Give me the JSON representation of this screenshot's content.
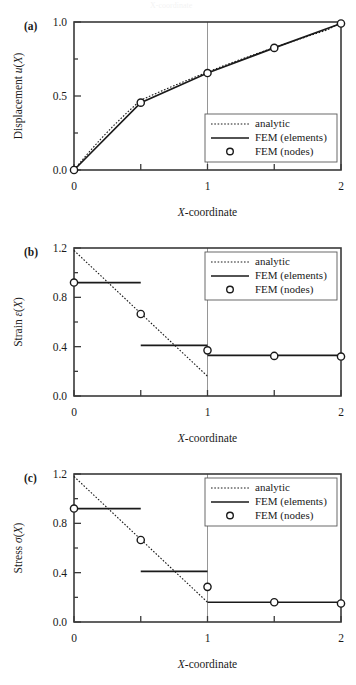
{
  "figure": {
    "panels": [
      {
        "tag": "(a)",
        "ylabel_prefix": "Displacement ",
        "ylabel_var": "u",
        "ylabel_suffix": "(X)",
        "xlabel_var": "X",
        "xlabel_rest": "-coordinate"
      },
      {
        "tag": "(b)",
        "ylabel_prefix": "Strain ",
        "ylabel_var": "ε",
        "ylabel_suffix": "(X)",
        "xlabel_var": "X",
        "xlabel_rest": "-coordinate"
      },
      {
        "tag": "(c)",
        "ylabel_prefix": "Stress ",
        "ylabel_var": "σ",
        "ylabel_suffix": "(X)",
        "xlabel_var": "X",
        "xlabel_rest": "-coordinate"
      }
    ],
    "legend": {
      "analytic": "analytic",
      "elements": "FEM (elements)",
      "nodes": "FEM (nodes)"
    },
    "colors": {
      "line": "#1a1a1a",
      "frame": "#3a3a3a",
      "gridline": "#8a8a8a",
      "marker_fill": "#ffffff",
      "background": "#ffffff"
    },
    "top_bleed_text": "X-coordinate"
  },
  "chart_data": [
    {
      "type": "line",
      "panel": "a",
      "title": "",
      "xlabel": "X-coordinate",
      "ylabel": "Displacement u(X)",
      "xlim": [
        0,
        2
      ],
      "ylim": [
        0,
        1.0
      ],
      "xticks": [
        0,
        0.5,
        1,
        1.5,
        2
      ],
      "xticklabels": [
        "0",
        "",
        "1",
        "",
        "2"
      ],
      "yticks": [
        0.0,
        0.5,
        1.0
      ],
      "yticklabels": [
        "0.0",
        "0.5",
        "1.0"
      ],
      "grid": false,
      "vertical_gridline_x": 1,
      "legend_position": "lower right",
      "series": [
        {
          "name": "analytic",
          "style": "dotted",
          "x": [
            0.0,
            0.1,
            0.2,
            0.3,
            0.4,
            0.5,
            0.6,
            0.7,
            0.8,
            0.9,
            1.0,
            1.1,
            1.2,
            1.3,
            1.4,
            1.5,
            1.6,
            1.7,
            1.8,
            1.9,
            2.0
          ],
          "y": [
            0.0,
            0.108,
            0.209,
            0.303,
            0.39,
            0.472,
            0.512,
            0.551,
            0.589,
            0.626,
            0.662,
            0.697,
            0.731,
            0.764,
            0.796,
            0.828,
            0.858,
            0.888,
            0.918,
            0.947,
            1.0
          ]
        },
        {
          "name": "FEM (elements)",
          "style": "solid",
          "x": [
            0.0,
            0.5,
            1.0,
            1.5,
            2.0
          ],
          "y": [
            0.0,
            0.455,
            0.655,
            0.825,
            0.99
          ]
        },
        {
          "name": "FEM (nodes)",
          "style": "marker",
          "x": [
            0.0,
            0.5,
            1.0,
            1.5,
            2.0
          ],
          "y": [
            0.0,
            0.455,
            0.655,
            0.825,
            0.99
          ]
        }
      ]
    },
    {
      "type": "line",
      "panel": "b",
      "title": "",
      "xlabel": "X-coordinate",
      "ylabel": "Strain ε(X)",
      "xlim": [
        0,
        2
      ],
      "ylim": [
        0,
        1.2
      ],
      "xticks": [
        0,
        0.5,
        1,
        1.5,
        2
      ],
      "xticklabels": [
        "0",
        "",
        "1",
        "",
        "2"
      ],
      "yticks": [
        0.0,
        0.4,
        0.8,
        1.2
      ],
      "yticklabels": [
        "0.0",
        "0.4",
        "0.8",
        "1.2"
      ],
      "grid": false,
      "vertical_gridline_x": 1,
      "legend_position": "upper right",
      "series": [
        {
          "name": "analytic",
          "style": "dotted",
          "x": [
            0.0,
            1.0
          ],
          "y": [
            1.18,
            0.16
          ]
        },
        {
          "name": "FEM (elements)",
          "style": "step",
          "segments": [
            {
              "x0": 0.0,
              "x1": 0.5,
              "y": 0.92
            },
            {
              "x0": 0.5,
              "x1": 1.0,
              "y": 0.41
            },
            {
              "x0": 1.0,
              "x1": 2.0,
              "y": 0.33
            }
          ]
        },
        {
          "name": "FEM (nodes)",
          "style": "marker",
          "x": [
            0.0,
            0.5,
            1.0,
            1.5,
            2.0
          ],
          "y": [
            0.92,
            0.665,
            0.37,
            0.325,
            0.32
          ]
        }
      ]
    },
    {
      "type": "line",
      "panel": "c",
      "title": "",
      "xlabel": "X-coordinate",
      "ylabel": "Stress σ(X)",
      "xlim": [
        0,
        2
      ],
      "ylim": [
        0,
        1.2
      ],
      "xticks": [
        0,
        0.5,
        1,
        1.5,
        2
      ],
      "xticklabels": [
        "0",
        "",
        "1",
        "",
        "2"
      ],
      "yticks": [
        0.0,
        0.4,
        0.8,
        1.2
      ],
      "yticklabels": [
        "0.0",
        "0.4",
        "0.8",
        "1.2"
      ],
      "grid": false,
      "vertical_gridline_x": 1,
      "legend_position": "upper right",
      "series": [
        {
          "name": "analytic",
          "style": "dotted",
          "x": [
            0.0,
            1.0
          ],
          "y": [
            1.18,
            0.16
          ]
        },
        {
          "name": "FEM (elements)",
          "style": "step",
          "segments": [
            {
              "x0": 0.0,
              "x1": 0.5,
              "y": 0.92
            },
            {
              "x0": 0.5,
              "x1": 1.0,
              "y": 0.41
            },
            {
              "x0": 1.0,
              "x1": 2.0,
              "y": 0.16
            }
          ]
        },
        {
          "name": "FEM (nodes)",
          "style": "marker",
          "x": [
            0.0,
            0.5,
            1.0,
            1.5,
            2.0
          ],
          "y": [
            0.92,
            0.665,
            0.285,
            0.16,
            0.15
          ]
        }
      ]
    }
  ]
}
